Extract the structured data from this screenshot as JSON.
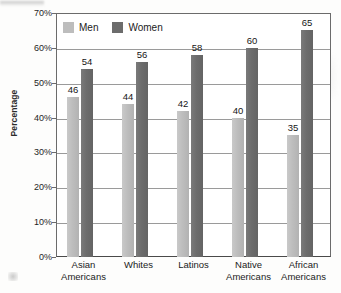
{
  "chart_data": {
    "type": "bar",
    "title": "",
    "xlabel": "",
    "ylabel": "Percentage",
    "ylim": [
      0,
      70
    ],
    "ytick_labels": [
      "0%",
      "10%",
      "20%",
      "30%",
      "40%",
      "50%",
      "60%",
      "70%"
    ],
    "ytick_values": [
      0,
      10,
      20,
      30,
      40,
      50,
      60,
      70
    ],
    "grid": true,
    "legend_position": "top-left-inside",
    "categories": [
      "Asian Americans",
      "Whites",
      "Latinos",
      "Native Americans",
      "African Americans"
    ],
    "category_lines": [
      [
        "Asian",
        "Americans"
      ],
      [
        "Whites",
        ""
      ],
      [
        "Latinos",
        ""
      ],
      [
        "Native",
        "Americans"
      ],
      [
        "African",
        "Americans"
      ]
    ],
    "series": [
      {
        "name": "Men",
        "color": "#bdbdbd",
        "values": [
          46,
          44,
          42,
          40,
          35
        ]
      },
      {
        "name": "Women",
        "color": "#6c6c6c",
        "values": [
          54,
          56,
          58,
          60,
          65
        ]
      }
    ]
  },
  "axis": {
    "y_title": "Percentage"
  },
  "legend": {
    "items": [
      {
        "label": "Men"
      },
      {
        "label": "Women"
      }
    ]
  },
  "colors": {
    "men_bar": "#bdbdbd",
    "women_bar": "#6c6c6c",
    "gridline": "#9a9a9a",
    "axis": "#4a4a4a",
    "text": "#1b1b1b",
    "background": "#ffffff"
  }
}
